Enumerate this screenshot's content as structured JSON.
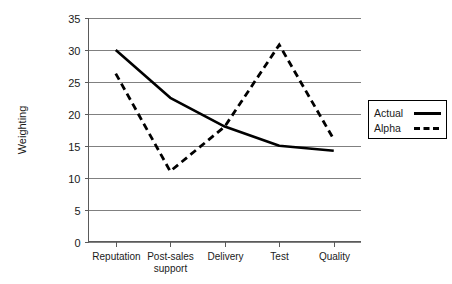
{
  "chart_data": {
    "type": "line",
    "title": "",
    "xlabel": "",
    "ylabel": "Weighting",
    "ylim": [
      0,
      35
    ],
    "ytick_step": 5,
    "yticks": [
      "0",
      "5",
      "10",
      "15",
      "20",
      "25",
      "30",
      "35"
    ],
    "grid": true,
    "legend_position": "right-outside",
    "categories": [
      "Reputation",
      "Post-sales support",
      "Delivery",
      "Test",
      "Quality"
    ],
    "category_lines": [
      [
        "Reputation"
      ],
      [
        "Post-sales",
        "support"
      ],
      [
        "Delivery"
      ],
      [
        "Test"
      ],
      [
        "Quality"
      ]
    ],
    "series": [
      {
        "name": "Actual",
        "style": "solid",
        "color": "#000000",
        "values": [
          30,
          22.5,
          18,
          15,
          14.2
        ]
      },
      {
        "name": "Alpha",
        "style": "dashed",
        "color": "#000000",
        "values": [
          26.3,
          11,
          18,
          30.8,
          16
        ]
      }
    ]
  },
  "legend": {
    "entries": [
      {
        "label": "Actual",
        "style": "solid"
      },
      {
        "label": "Alpha",
        "style": "dashed"
      }
    ]
  },
  "colors": {
    "background": "#ffffff",
    "gridline": "#808080",
    "axis": "#5a5a5a",
    "series": "#000000"
  }
}
